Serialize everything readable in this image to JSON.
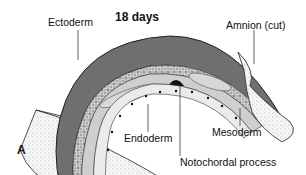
{
  "figure": {
    "title": "18 days",
    "panel_letter": "A",
    "labels": {
      "ectoderm": "Ectoderm",
      "amnion": "Amnion (cut)",
      "endoderm": "Endoderm",
      "mesoderm": "Mesoderm",
      "notochordal_process": "Notochordal process"
    },
    "colors": {
      "ectoderm_fill": "#6e6e6e",
      "cell_layer": "#d9d9d9",
      "mesoderm_fill": "#c8c8c8",
      "endoderm_fill": "#e6e6e6",
      "notochord": "#111111",
      "amnion_fill": "#f4f4f4",
      "outline": "#222222"
    }
  }
}
